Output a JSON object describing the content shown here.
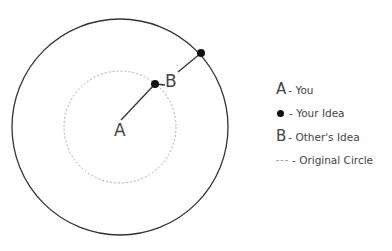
{
  "diagram": {
    "outer_circle": {
      "cx": 120,
      "cy": 127,
      "r": 108,
      "stroke": "#333333"
    },
    "original_circle": {
      "cx": 120,
      "cy": 127,
      "r": 56,
      "stroke": "#aaaaaa",
      "dashed": true
    },
    "you_label": "A",
    "others_idea_label": "B",
    "your_idea_points": [
      {
        "x": 155,
        "y": 84
      },
      {
        "x": 201,
        "y": 53
      }
    ]
  },
  "legend": {
    "items": [
      {
        "key": "A",
        "text": "- You"
      },
      {
        "key": "dot",
        "text": "- Your Idea"
      },
      {
        "key": "B",
        "text": "- Other's Idea"
      },
      {
        "key": "dash",
        "text": "- Original Circle"
      }
    ]
  }
}
